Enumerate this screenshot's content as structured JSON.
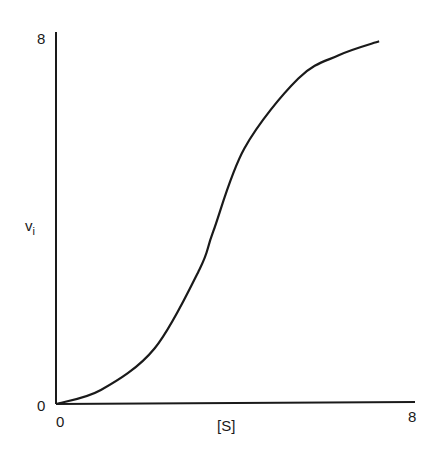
{
  "chart_data": {
    "type": "line",
    "title": "",
    "xlabel": "[S]",
    "ylabel": "v_i",
    "xlim": [
      0,
      8
    ],
    "ylim": [
      0,
      8
    ],
    "x_ticks": [
      "0",
      "8"
    ],
    "y_ticks": [
      "0",
      "8"
    ],
    "grid": false,
    "legend": null,
    "series": [
      {
        "name": "sigmoidal curve",
        "x": [
          0,
          1.0,
          2.2,
          3.2,
          3.5,
          4.2,
          5.4,
          6.3,
          7.2
        ],
        "y": [
          0,
          0.3,
          1.2,
          2.9,
          3.7,
          5.5,
          7.0,
          7.5,
          7.8
        ]
      }
    ]
  },
  "labels": {
    "y_top": "8",
    "y_bottom": "0",
    "x_left": "0",
    "x_right": "8",
    "xlabel": "[S]",
    "ylabel_main": "v",
    "ylabel_sub": "i"
  }
}
